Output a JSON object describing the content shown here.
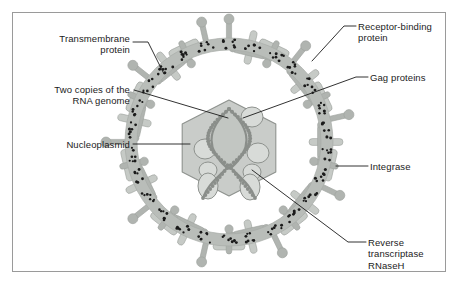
{
  "figure": {
    "border_color": "#9a9a9a",
    "background": "#ffffff",
    "leader_line_color": "#1b1b1b",
    "text_color": "#1b1b1b"
  },
  "palette": {
    "envelope_ring": "#b9bdb9",
    "envelope_ring_edge": "#a8aca8",
    "spike_light": "#c6cac6",
    "spike_mid": "#b0b4b0",
    "spike_dark": "#9ea29e",
    "dot": "#1b1b1b",
    "capsid_fill": "#c9ccc9",
    "capsid_edge": "#8e928e",
    "genome_fill": "#c2c6c2",
    "genome_edge": "#8a8e8a",
    "protein_fill": "#d8dbd8",
    "protein_edge": "#8e928e"
  },
  "labels": [
    {
      "id": "transmembrane-protein",
      "text": "Transmembrane\nprotein",
      "align": "right",
      "x": 18,
      "y": 33,
      "w": 112
    },
    {
      "id": "two-copies-rna-genome",
      "text": "Two copies of the\nRNA genome",
      "align": "right",
      "x": 14,
      "y": 84,
      "w": 116
    },
    {
      "id": "nucleoplasmid",
      "text": "Nucleoplasmid",
      "align": "right",
      "x": 18,
      "y": 139,
      "w": 112
    },
    {
      "id": "receptor-binding-protein",
      "text": "Receptor-binding\nprotein",
      "align": "left",
      "x": 358,
      "y": 21,
      "w": 100
    },
    {
      "id": "gag-proteins",
      "text": "Gag proteins",
      "align": "left",
      "x": 370,
      "y": 72,
      "w": 88
    },
    {
      "id": "integrase",
      "text": "Integrase",
      "align": "left",
      "x": 370,
      "y": 161,
      "w": 88
    },
    {
      "id": "reverse-transcriptase-rnaseh",
      "text": "Reverse\ntranscriptase\nRNaseH",
      "align": "left",
      "x": 368,
      "y": 237,
      "w": 90
    }
  ],
  "leader_lines": [
    {
      "id": "leader-transmembrane-protein",
      "points": "133,42 148,42 164,74"
    },
    {
      "id": "leader-two-copies-rna-genome",
      "points": "134,90 228,118"
    },
    {
      "id": "leader-nucleoplasmid",
      "points": "133,144 190,144"
    },
    {
      "id": "leader-receptor-binding-protein",
      "points": "356,26 344,26 312,61"
    },
    {
      "id": "leader-gag-proteins",
      "points": "368,77 356,77 243,118"
    },
    {
      "id": "leader-integrase",
      "points": "368,166 336,166"
    },
    {
      "id": "leader-reverse-transcriptase",
      "points": "366,242 348,242 252,170"
    }
  ],
  "structures": {
    "envelope": {
      "name": "viral-envelope-ring",
      "cx": 229,
      "cy": 142,
      "r_outer": 104,
      "r_inner": 92,
      "spike_count": 28
    },
    "capsid": {
      "name": "hexagonal-capsid",
      "cx": 229,
      "cy": 148,
      "radius": 50
    },
    "genome": {
      "name": "rna-genome-lens",
      "cx": 229,
      "cy": 139
    },
    "internal_proteins": [
      {
        "name": "protein-circle",
        "cx": 252,
        "cy": 117,
        "rx": 11,
        "ry": 10
      },
      {
        "name": "protein-circle",
        "cx": 205,
        "cy": 149,
        "rx": 11,
        "ry": 10
      },
      {
        "name": "protein-circle",
        "cx": 258,
        "cy": 153,
        "rx": 11,
        "ry": 10
      },
      {
        "name": "protein-circle",
        "cx": 208,
        "cy": 170,
        "rx": 9,
        "ry": 8
      },
      {
        "name": "protein-circle",
        "cx": 252,
        "cy": 172,
        "rx": 9,
        "ry": 8
      },
      {
        "name": "protein-oval",
        "cx": 208,
        "cy": 186,
        "rx": 10,
        "ry": 13
      },
      {
        "name": "protein-oval",
        "cx": 250,
        "cy": 187,
        "rx": 10,
        "ry": 13
      }
    ]
  }
}
